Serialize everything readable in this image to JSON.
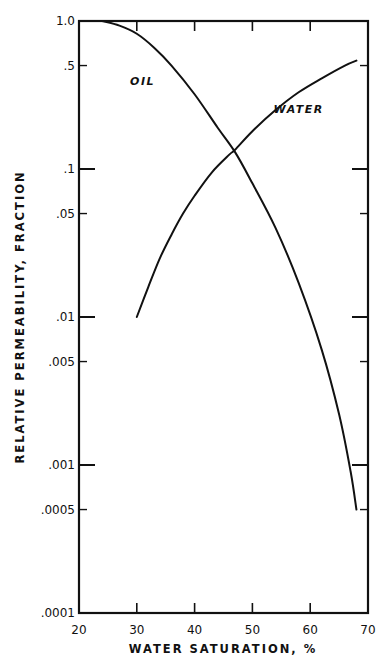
{
  "chart_data": {
    "type": "line",
    "title": "",
    "xlabel": "WATER SATURATION, %",
    "ylabel": "RELATIVE PERMEABILITY, FRACTION",
    "xlim": [
      20,
      70
    ],
    "ylim": [
      0.0001,
      1.0
    ],
    "yscale": "log",
    "grid": false,
    "legend": "inline labels",
    "x_ticks": [
      20,
      30,
      40,
      50,
      60,
      70
    ],
    "x_tick_labels": [
      "20",
      "30",
      "40",
      "50",
      "60",
      "70"
    ],
    "y_ticks": [
      1.0,
      0.5,
      0.1,
      0.05,
      0.01,
      0.005,
      0.001,
      0.0005,
      0.0001
    ],
    "y_tick_labels": [
      "1.0",
      ".5",
      ".1",
      ".05",
      ".01",
      ".005",
      ".001",
      ".0005",
      ".0001"
    ],
    "series": [
      {
        "name": "OIL",
        "x": [
          24,
          27,
          30,
          33,
          36,
          40,
          44,
          47,
          50,
          54,
          58,
          62,
          65,
          67,
          68
        ],
        "values": [
          1.0,
          0.93,
          0.82,
          0.66,
          0.5,
          0.32,
          0.19,
          0.13,
          0.08,
          0.04,
          0.017,
          0.006,
          0.0022,
          0.0009,
          0.0005
        ]
      },
      {
        "name": "WATER",
        "x": [
          30,
          32,
          34,
          36,
          38,
          40,
          43,
          46,
          47,
          50,
          54,
          58,
          62,
          66,
          68
        ],
        "values": [
          0.01,
          0.016,
          0.025,
          0.036,
          0.05,
          0.066,
          0.095,
          0.125,
          0.135,
          0.18,
          0.25,
          0.33,
          0.41,
          0.5,
          0.54
        ]
      }
    ],
    "annotations": [
      {
        "text": "OIL",
        "x": 31,
        "y": 0.37
      },
      {
        "text": "WATER",
        "x": 58,
        "y": 0.24
      }
    ]
  }
}
